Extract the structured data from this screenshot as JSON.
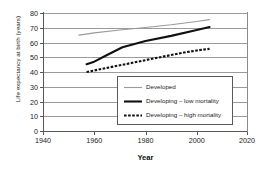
{
  "chart_data": {
    "type": "line",
    "title": "",
    "xlabel": "Year",
    "ylabel": "Life expectancy at birth (years)",
    "xlim": [
      1940,
      2020
    ],
    "ylim": [
      0,
      80
    ],
    "xticks": [
      1940,
      1960,
      1980,
      2000,
      2020
    ],
    "yticks": [
      0,
      10,
      20,
      30,
      40,
      50,
      60,
      70,
      80
    ],
    "grid": "horizontal",
    "legend_position": "center-right-inside",
    "series": [
      {
        "name": "Developed",
        "style": "thin-solid-gray",
        "color": "#9a9a9a",
        "x": [
          1954,
          1960,
          1970,
          1980,
          1990,
          2000,
          2005
        ],
        "y": [
          65.0,
          66.5,
          68.5,
          70.2,
          72.0,
          74.2,
          75.5
        ]
      },
      {
        "name": "Developing – low mortality",
        "style": "thick-solid-black",
        "color": "#111111",
        "x": [
          1957,
          1960,
          1965,
          1971,
          1980,
          1990,
          2000,
          2005
        ],
        "y": [
          45.3,
          47.0,
          51.5,
          56.8,
          61.0,
          64.5,
          68.5,
          70.5
        ]
      },
      {
        "name": "Developing – high mortality",
        "style": "thick-dashed-black",
        "color": "#111111",
        "x": [
          1957,
          1965,
          1975,
          1985,
          1995,
          2000,
          2005
        ],
        "y": [
          40.0,
          42.8,
          46.3,
          49.8,
          53.2,
          54.6,
          55.7
        ]
      }
    ]
  },
  "legend": {
    "items": [
      {
        "label": "Developed"
      },
      {
        "label": "Developing – low mortality"
      },
      {
        "label": "Developing – high mortality"
      }
    ]
  },
  "axes": {
    "y_title": "Life expectancy at birth (years)",
    "x_title": "Year",
    "y_tick_labels": [
      "80",
      "70",
      "60",
      "50",
      "40",
      "30",
      "20",
      "10",
      "0"
    ],
    "x_tick_labels": [
      "1940",
      "1960",
      "1980",
      "2000",
      "2020"
    ]
  },
  "colors": {
    "developed_line": "#9a9a9a",
    "developing_line": "#111111",
    "gridline": "#9b9b9b",
    "axis": "#585858",
    "text": "#1a1a1a",
    "background": "#ffffff"
  }
}
